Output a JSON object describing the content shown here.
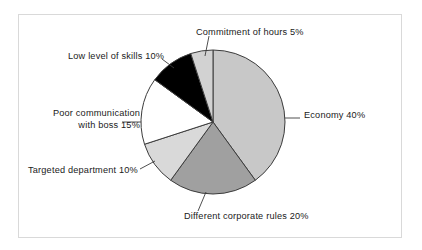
{
  "figure": {
    "background_color": "#ffffff",
    "frame_color": "#d9d9d9",
    "outline_color": "#3c3c3c"
  },
  "chart_data": {
    "type": "pie",
    "title": "",
    "subtitle": "",
    "xlabel": "",
    "ylabel": "",
    "legend_position": "none",
    "grid": false,
    "start_angle_deg": 0,
    "direction": "clockwise",
    "units": "percent",
    "total": 100,
    "categories": [
      "Economy",
      "Different corporate rules",
      "Targeted department",
      "Poor communication with boss",
      "Low level of skills",
      "Commitment of hours"
    ],
    "values": [
      40,
      20,
      10,
      15,
      10,
      5
    ],
    "labels": [
      "Economy 40%",
      "Different corporate rules 20%",
      "Targeted department 10%",
      "Poor communication with boss 15%",
      "Low level of skills 10%",
      "Commitment of hours 5%"
    ],
    "colors": [
      "#c8c8c8",
      "#a0a0a0",
      "#d9d9d9",
      "#ffffff",
      "#000000",
      "#d2d2d2"
    ],
    "slices": [
      {
        "name": "Economy",
        "value": 40,
        "value_text": "40%",
        "label": "Economy 40%",
        "color": "#c8c8c8",
        "start_deg": 0,
        "end_deg": 144
      },
      {
        "name": "Different corporate rules",
        "value": 20,
        "value_text": "20%",
        "label": "Different corporate rules 20%",
        "color": "#a0a0a0",
        "start_deg": 144,
        "end_deg": 216
      },
      {
        "name": "Targeted department",
        "value": 10,
        "value_text": "10%",
        "label": "Targeted department 10%",
        "color": "#d9d9d9",
        "start_deg": 216,
        "end_deg": 252
      },
      {
        "name": "Poor communication with boss",
        "value": 15,
        "value_text": "15%",
        "label": "Poor communication with boss 15%",
        "label_line_1": "Poor communication",
        "label_line_2": "with boss 15%",
        "color": "#ffffff",
        "start_deg": 252,
        "end_deg": 306
      },
      {
        "name": "Low level of skills",
        "value": 10,
        "value_text": "10%",
        "label": "Low level of skills 10%",
        "color": "#000000",
        "start_deg": 306,
        "end_deg": 342
      },
      {
        "name": "Commitment of hours",
        "value": 5,
        "value_text": "5%",
        "label": "Commitment of hours 5%",
        "color": "#d2d2d2",
        "start_deg": 342,
        "end_deg": 360
      }
    ]
  }
}
